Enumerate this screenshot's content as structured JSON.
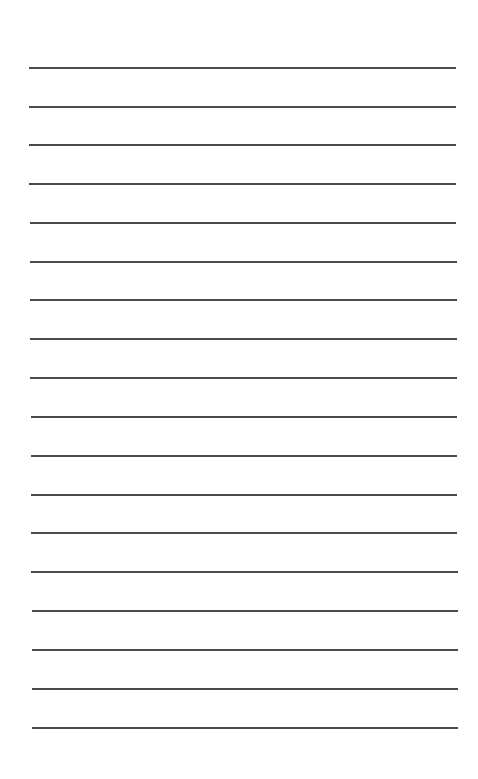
{
  "page": {
    "type": "lined-paper",
    "background": "#ffffff",
    "line_color": "#4a4a4a",
    "line_count": 18,
    "lines": [
      {
        "y": 67,
        "x1": 29,
        "x2": 456
      },
      {
        "y": 106,
        "x1": 29,
        "x2": 456
      },
      {
        "y": 144,
        "x1": 29,
        "x2": 456
      },
      {
        "y": 183,
        "x1": 29,
        "x2": 456
      },
      {
        "y": 222,
        "x1": 30,
        "x2": 456
      },
      {
        "y": 261,
        "x1": 30,
        "x2": 457
      },
      {
        "y": 299,
        "x1": 30,
        "x2": 457
      },
      {
        "y": 338,
        "x1": 30,
        "x2": 457
      },
      {
        "y": 377,
        "x1": 30,
        "x2": 457
      },
      {
        "y": 416,
        "x1": 31,
        "x2": 457
      },
      {
        "y": 455,
        "x1": 31,
        "x2": 457
      },
      {
        "y": 494,
        "x1": 31,
        "x2": 457
      },
      {
        "y": 532,
        "x1": 31,
        "x2": 457
      },
      {
        "y": 571,
        "x1": 31,
        "x2": 458
      },
      {
        "y": 610,
        "x1": 32,
        "x2": 458
      },
      {
        "y": 649,
        "x1": 32,
        "x2": 458
      },
      {
        "y": 688,
        "x1": 32,
        "x2": 458
      },
      {
        "y": 727,
        "x1": 32,
        "x2": 458
      }
    ]
  }
}
